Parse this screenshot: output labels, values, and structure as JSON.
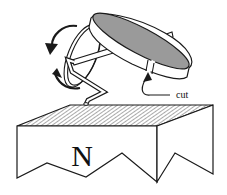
{
  "figure": {
    "labels": {
      "cut": "cut",
      "pole": "N"
    },
    "colors": {
      "stroke": "#1a1a1a",
      "ring_inner": "#9a9a9a",
      "hatch": "#444444",
      "background": "#ffffff"
    },
    "components": [
      {
        "name": "magnet",
        "pole": "N"
      },
      {
        "name": "crank-wire"
      },
      {
        "name": "rotation-arrow"
      },
      {
        "name": "split-ring",
        "feature": "cut"
      }
    ]
  }
}
